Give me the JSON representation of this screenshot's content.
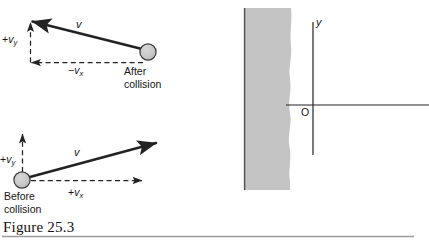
{
  "figure": {
    "caption": "Figure 25.3",
    "colors": {
      "line": "#232323",
      "ball_fill": "#c9c9c9",
      "ball_stroke": "#3a3a3a",
      "wall_fill": "#c4c4c4",
      "wall_edge": "#555555",
      "text": "#141414",
      "rule": "#9a9a9a"
    }
  },
  "after_collision": {
    "vector_label": "v",
    "vy_label_sign": "+",
    "vy_label_symbol": "v",
    "vy_label_sub": "y",
    "vx_label_sign": "−",
    "vx_label_symbol": "v",
    "vx_label_sub": "x",
    "state_line1": "After",
    "state_line2": "collision"
  },
  "before_collision": {
    "vector_label": "v",
    "vy_label_sign": "+",
    "vy_label_symbol": "v",
    "vy_label_sub": "y",
    "vx_label_sign": "+",
    "vx_label_symbol": "v",
    "vx_label_sub": "x",
    "state_line1": "Before",
    "state_line2": "collision"
  },
  "axes": {
    "y_axis_label": "y",
    "origin_label": "O"
  }
}
